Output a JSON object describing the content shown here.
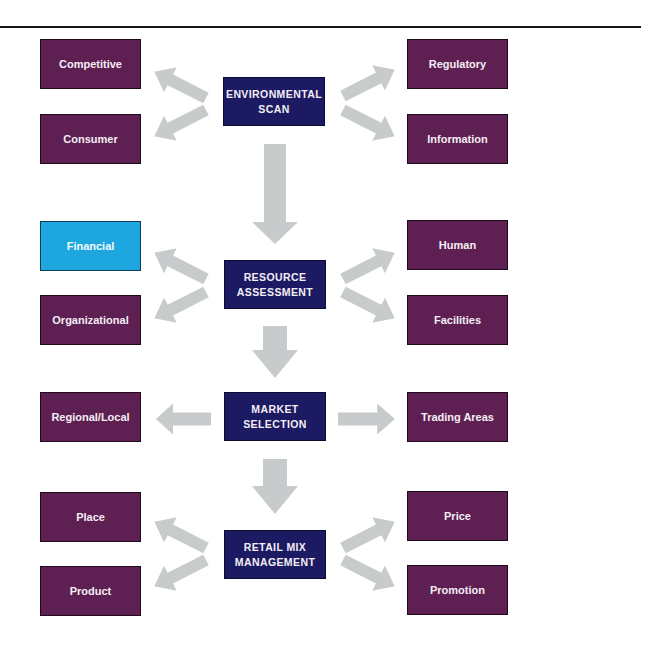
{
  "diagram": {
    "colors": {
      "side_box": "#5e1f52",
      "highlight_box": "#1ea6de",
      "center_box": "#1c1a62",
      "arrow": "#c8cbcb",
      "rule": "#151515"
    },
    "stages": [
      {
        "label": "ENVIRONMENTAL\nSCAN",
        "left": [
          "Competitive",
          "Consumer"
        ],
        "right": [
          "Regulatory",
          "Information"
        ]
      },
      {
        "label": "RESOURCE\nASSESSMENT",
        "left": [
          "Financial",
          "Organizational"
        ],
        "right": [
          "Human",
          "Facilities"
        ],
        "highlighted": "Financial"
      },
      {
        "label": "MARKET\nSELECTION",
        "left": [
          "Regional/Local"
        ],
        "right": [
          "Trading Areas"
        ]
      },
      {
        "label": "RETAIL MIX\nMANAGEMENT",
        "left": [
          "Place",
          "Product"
        ],
        "right": [
          "Price",
          "Promotion"
        ]
      }
    ]
  }
}
